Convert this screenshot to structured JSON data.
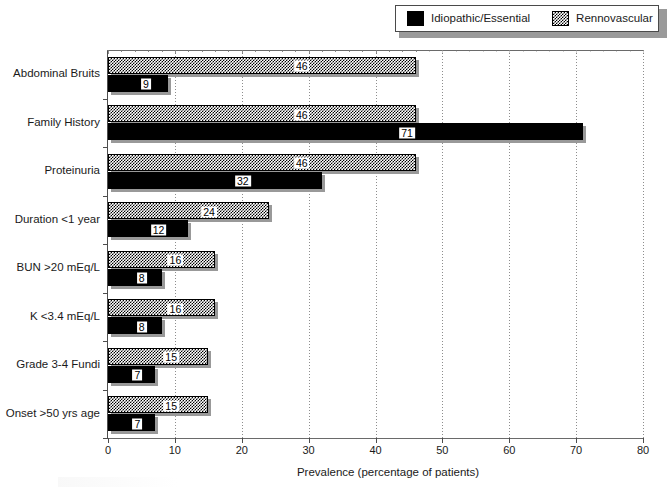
{
  "legend": {
    "position": "top-right",
    "entries": [
      {
        "label": "Idiopathic/Essential",
        "swatch": "solid-black-swatch",
        "color": "#000000"
      },
      {
        "label": "Rennovascular",
        "swatch": "checkered-swatch",
        "color": "#808080"
      }
    ]
  },
  "axis": {
    "x_title": "Prevalence (percentage of patients)",
    "x_ticks": [
      "0",
      "10",
      "20",
      "30",
      "40",
      "50",
      "60",
      "70",
      "80"
    ]
  },
  "chart_data": {
    "type": "bar",
    "orientation": "horizontal",
    "title": "",
    "xlabel": "Prevalence (percentage of patients)",
    "ylabel": "",
    "xlim": [
      0,
      80
    ],
    "xticks": [
      0,
      10,
      20,
      30,
      40,
      50,
      60,
      70,
      80
    ],
    "grid": true,
    "grid_axis": "x",
    "legend_position": "top-right",
    "data_labels": true,
    "categories": [
      "Abdominal Bruits",
      "Family History",
      "Proteinuria",
      "Duration <1 year",
      "BUN >20 mEq/L",
      "K <3.4 mEq/L",
      "Grade 3-4 Fundi",
      "Onset >50 yrs age"
    ],
    "series": [
      {
        "name": "Rennovascular",
        "color": "#808080",
        "pattern": "checkered",
        "values": [
          46,
          46,
          46,
          24,
          16,
          16,
          15,
          15
        ]
      },
      {
        "name": "Idiopathic/Essential",
        "color": "#000000",
        "pattern": "solid",
        "values": [
          9,
          71,
          32,
          12,
          8,
          8,
          7,
          7
        ]
      }
    ]
  }
}
